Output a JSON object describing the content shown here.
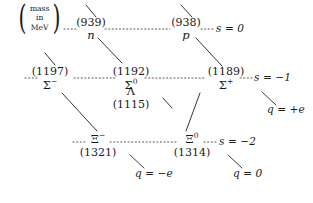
{
  "figure": {
    "type": "baryon-octet-weight-diagram",
    "legend": {
      "line1": "mass",
      "line2": "in",
      "line3": "MeV",
      "paren_left": "(",
      "paren_right": ")"
    },
    "nodes": [
      {
        "id": "neutron",
        "mass": "(939)",
        "symbol": "n",
        "charge_label": "q = 0",
        "strangeness": "s = 0"
      },
      {
        "id": "proton",
        "mass": "(938)",
        "symbol": "p",
        "charge_label": "q = +e",
        "strangeness": "s = 0"
      },
      {
        "id": "sigma-minus",
        "mass": "(1197)",
        "symbol_base": "Σ",
        "symbol_sup": "−",
        "strangeness": "s = -1"
      },
      {
        "id": "sigma-zero",
        "mass": "(1192)",
        "symbol_base": "Σ",
        "symbol_sup": "0",
        "strangeness": "s = -1"
      },
      {
        "id": "lambda",
        "mass": "(1115)",
        "symbol_base": "Λ",
        "symbol_sup": "",
        "strangeness": "s = -1"
      },
      {
        "id": "sigma-plus",
        "mass": "(1189)",
        "symbol_base": "Σ",
        "symbol_sup": "+",
        "strangeness": "s = -1"
      },
      {
        "id": "xi-minus",
        "mass": "(1321)",
        "symbol_base": "Ξ",
        "symbol_sup": "−",
        "strangeness": "s = -2"
      },
      {
        "id": "xi-zero",
        "mass": "(1314)",
        "symbol_base": "Ξ",
        "symbol_sup": "0",
        "strangeness": "s = -2"
      }
    ],
    "strangeness_labels": {
      "row_top": "s = 0",
      "row_middle": "s = -1",
      "row_bottom": "s = -2"
    },
    "charge_labels": {
      "negative": "q = -e",
      "neutral": "q = 0",
      "positive": "q = +e"
    },
    "texts": {
      "n939_mass": "(939)",
      "n939_sym": "n",
      "p938_mass": "(938)",
      "p938_sym": "p",
      "s1192_mass": "(1192)",
      "s1192_sym": "Σ",
      "s1192_sup": "0",
      "lam_sym": "Λ",
      "lam_mass": "(1115)",
      "s1197_mass": "(1197)",
      "s1197_sym": "Σ",
      "s1197_sup": "−",
      "s1189_mass": "(1189)",
      "s1189_sym": "Σ",
      "s1189_sup": "+",
      "x1321_sym": "Ξ",
      "x1321_sup": "−",
      "x1321_mass": "(1321)",
      "x1314_sym": "Ξ",
      "x1314_sup": "0",
      "x1314_mass": "(1314)",
      "s0": "s = 0",
      "sm1": "s = −1",
      "sm2": "s = −2",
      "qminus": "q = −e",
      "qzero": "q = 0",
      "qplus": "q = +e"
    },
    "colors": {
      "ink": "#1a1a1a",
      "line": "#2b2b2b",
      "dotted": "#555555",
      "background": "#ffffff"
    }
  }
}
